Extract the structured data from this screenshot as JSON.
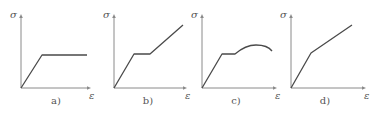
{
  "figure": {
    "y_axis_symbol": "σ",
    "x_axis_symbol": "ε",
    "colors": {
      "axis": "#8a8a8a",
      "curve": "#4a4a4a",
      "text": "#555555"
    },
    "panels": [
      {
        "id": "a",
        "label": "a)",
        "type": "elastic-perfectly-plastic",
        "origin": [
          21,
          88
        ],
        "axis_top": 14,
        "axis_right": 91,
        "points": [
          [
            21,
            88
          ],
          [
            42,
            55
          ],
          [
            87,
            55
          ]
        ],
        "curve_path": "M21,88 L42,55 L87,55",
        "sigma_pos": [
          10,
          18
        ],
        "eps_pos": [
          89,
          99
        ],
        "label_pos": [
          56,
          104
        ]
      },
      {
        "id": "b",
        "label": "b)",
        "type": "elastic-plastic-linear-hardening",
        "origin": [
          114,
          88
        ],
        "axis_top": 14,
        "axis_right": 187,
        "points": [
          [
            114,
            88
          ],
          [
            134,
            54
          ],
          [
            150,
            54
          ],
          [
            183,
            25
          ]
        ],
        "curve_path": "M114,88 L134,54 L150,54 L183,25",
        "sigma_pos": [
          103,
          18
        ],
        "eps_pos": [
          185,
          99
        ],
        "label_pos": [
          148,
          104
        ]
      },
      {
        "id": "c",
        "label": "c)",
        "type": "elastic-plastic-nonlinear-hardening-softening",
        "origin": [
          202,
          88
        ],
        "axis_top": 14,
        "axis_right": 277,
        "points": [
          [
            202,
            88
          ],
          [
            222,
            54
          ],
          [
            235,
            54
          ],
          [
            255,
            46
          ],
          [
            272,
            51
          ]
        ],
        "curve_path": "M202,88 L222,54 L235,54 C242,48 250,45 256,45 C263,45 269,47 272,51",
        "sigma_pos": [
          191,
          18
        ],
        "eps_pos": [
          275,
          99
        ],
        "label_pos": [
          236,
          104
        ]
      },
      {
        "id": "d",
        "label": "d)",
        "type": "bilinear-elastic-hardening",
        "origin": [
          291,
          88
        ],
        "axis_top": 14,
        "axis_right": 366,
        "points": [
          [
            291,
            88
          ],
          [
            311,
            53
          ],
          [
            352,
            25
          ]
        ],
        "curve_path": "M291,88 L311,53 L352,25",
        "sigma_pos": [
          280,
          18
        ],
        "eps_pos": [
          364,
          99
        ],
        "label_pos": [
          325,
          104
        ]
      }
    ]
  }
}
